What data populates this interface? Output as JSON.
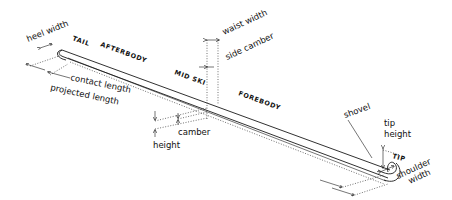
{
  "diagram": {
    "subject": "ski",
    "labels": {
      "heel_width": "heel width",
      "tail": "TAIL",
      "afterbody": "AFTERBODY",
      "contact_length": "contact length",
      "projected_length": "projected length",
      "waist_width": "waist width",
      "side_camber": "side camber",
      "mid_ski": "MID SKI",
      "forebody": "FOREBODY",
      "camber": "camber",
      "height": "height",
      "shovel": "shovel",
      "tip_height": "tip height",
      "tip": "TIP",
      "shoulder_width": "shoulder width"
    },
    "colors": {
      "ink": "#1a1a1a",
      "background": "#ffffff"
    }
  }
}
